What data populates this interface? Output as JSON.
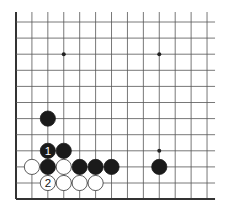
{
  "board": {
    "cols": 13,
    "rows": 12,
    "origin_x": 16,
    "origin_y": 22,
    "spacing_x": 15.92,
    "spacing_y": 16.1,
    "line_color": "#555555",
    "edge_color": "#333333",
    "open_top": true,
    "open_right": true,
    "thick_left": true,
    "thick_bottom": true
  },
  "star_points": [
    {
      "col": 3,
      "row": 2
    },
    {
      "col": 9,
      "row": 2
    },
    {
      "col": 9,
      "row": 8
    }
  ],
  "stones": [
    {
      "color": "black",
      "col": 2,
      "row": 6,
      "label": ""
    },
    {
      "color": "black",
      "col": 2,
      "row": 8,
      "label": "1"
    },
    {
      "color": "black",
      "col": 3,
      "row": 8,
      "label": ""
    },
    {
      "color": "white",
      "col": 1,
      "row": 9,
      "label": ""
    },
    {
      "color": "black",
      "col": 2,
      "row": 9,
      "label": ""
    },
    {
      "color": "white",
      "col": 3,
      "row": 9,
      "label": ""
    },
    {
      "color": "black",
      "col": 4,
      "row": 9,
      "label": ""
    },
    {
      "color": "black",
      "col": 5,
      "row": 9,
      "label": ""
    },
    {
      "color": "black",
      "col": 6,
      "row": 9,
      "label": ""
    },
    {
      "color": "black",
      "col": 9,
      "row": 9,
      "label": ""
    },
    {
      "color": "white",
      "col": 2,
      "row": 10,
      "label": "2"
    },
    {
      "color": "white",
      "col": 3,
      "row": 10,
      "label": ""
    },
    {
      "color": "white",
      "col": 4,
      "row": 10,
      "label": ""
    },
    {
      "color": "white",
      "col": 5,
      "row": 10,
      "label": ""
    }
  ],
  "colors": {
    "black_stone": "#1a1a1a",
    "white_stone": "#ffffff",
    "white_stone_border": "#333333",
    "black_label": "#ffffff",
    "white_label": "#111111"
  }
}
